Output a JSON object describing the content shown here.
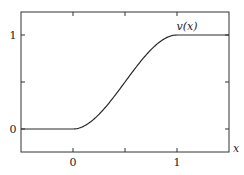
{
  "chart_data": {
    "type": "line",
    "title": "",
    "xlabel": "x",
    "ylabel": "",
    "xlim": [
      -0.5,
      1.5
    ],
    "ylim": [
      -0.245,
      1.245
    ],
    "grid": false,
    "legend": null,
    "x_ticks": [
      0,
      0.5,
      1
    ],
    "x_tick_labels": [
      "0",
      "",
      "1"
    ],
    "y_ticks": [
      0,
      0.5,
      1
    ],
    "y_tick_labels": [
      "0",
      "",
      "1"
    ],
    "series": [
      {
        "name": "v(x)",
        "description": "smooth step: 0 for x<=0, rises smoothly to 1 at x=1, 1 for x>=1",
        "x": [
          -0.5,
          0,
          0.1,
          0.2,
          0.3,
          0.4,
          0.5,
          0.6,
          0.7,
          0.8,
          0.9,
          1.0,
          1.5
        ],
        "y": [
          0,
          0,
          0.028,
          0.104,
          0.216,
          0.352,
          0.5,
          0.648,
          0.784,
          0.896,
          0.972,
          1,
          1
        ]
      }
    ],
    "annotations": [
      {
        "text": "v(x)",
        "x": 1.1,
        "y": 1.08
      }
    ]
  },
  "labels": {
    "x_axis": "x",
    "curve": "v(x)",
    "tick_x0": "0",
    "tick_x1": "1",
    "tick_y0": "0",
    "tick_y1": "1"
  },
  "colors": {
    "frame": "#333333",
    "curve": "#2a2a2a",
    "text": "#222222"
  }
}
